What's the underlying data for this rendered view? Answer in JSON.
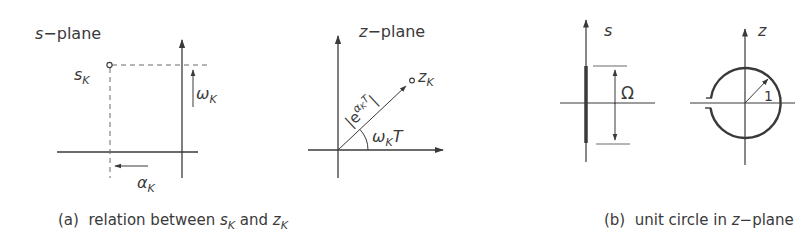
{
  "panel_a": {
    "s_plane": {
      "title_var": "s",
      "title_rest": "−plane",
      "point_label_main": "s",
      "point_label_sub": "K",
      "omega_main": "ω",
      "omega_sub": "K",
      "alpha_main": "α",
      "alpha_sub": "K"
    },
    "z_plane": {
      "title_var": "z",
      "title_rest": "−plane",
      "point_label_main": "z",
      "point_label_sub": "K",
      "magnitude_open": "|e",
      "magnitude_exp": "α",
      "magnitude_exp_sub": "K",
      "magnitude_exp_T": "T",
      "magnitude_close": "|",
      "angle_main": "ω",
      "angle_sub": "K",
      "angle_T": "T"
    },
    "caption": {
      "prefix": "(a)  relation between ",
      "s_main": "s",
      "s_sub": "K",
      "mid": " and ",
      "z_main": "z",
      "z_sub": "K"
    }
  },
  "panel_b": {
    "s_axis_label": "s",
    "omega_label": "Ω",
    "z_axis_label": "z",
    "radius_label": "1",
    "caption": {
      "prefix": "(b)  unit circle in ",
      "var": "z",
      "rest": "−plane"
    }
  },
  "colors": {
    "ink": "#3a3a3a",
    "light_ink": "#6a6a6a",
    "background": "#ffffff"
  }
}
